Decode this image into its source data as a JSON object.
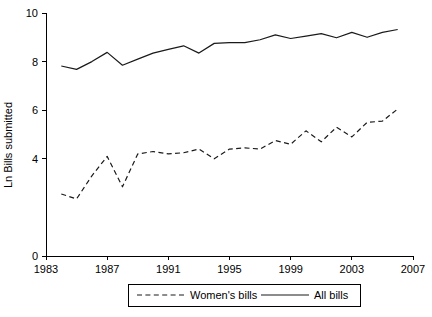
{
  "chart_data": {
    "type": "line",
    "title": "",
    "xlabel": "",
    "ylabel": "Ln Bills submitted",
    "xlim": [
      1983,
      2007
    ],
    "ylim": [
      0,
      10
    ],
    "xticks": [
      1983,
      1987,
      1991,
      1995,
      1999,
      2003,
      2007
    ],
    "xtick_labels": [
      "1983",
      "1987",
      "1991",
      "1995",
      "1999",
      "2003",
      "2007"
    ],
    "yticks": [
      0,
      4,
      6,
      8,
      10
    ],
    "ytick_labels": [
      "0",
      "4",
      "6",
      "8",
      "10"
    ],
    "grid": false,
    "legend_position": "below-center",
    "x": [
      1984,
      1985,
      1986,
      1987,
      1988,
      1989,
      1990,
      1991,
      1992,
      1993,
      1994,
      1995,
      1996,
      1997,
      1998,
      1999,
      2000,
      2001,
      2002,
      2003,
      2004,
      2005,
      2006
    ],
    "series": [
      {
        "name": "Women's bills",
        "style": "dashed",
        "color": "#1a1a1a",
        "values": [
          2.55,
          2.35,
          3.3,
          4.1,
          2.85,
          4.2,
          4.3,
          4.2,
          4.25,
          4.4,
          4.0,
          4.4,
          4.45,
          4.4,
          4.75,
          4.6,
          5.15,
          4.7,
          5.3,
          4.9,
          5.5,
          5.55,
          6.05
        ]
      },
      {
        "name": "All bills",
        "style": "solid",
        "color": "#1a1a1a",
        "values": [
          7.82,
          7.68,
          8.0,
          8.38,
          7.85,
          8.1,
          8.35,
          8.5,
          8.65,
          8.35,
          8.75,
          8.78,
          8.78,
          8.9,
          9.1,
          8.95,
          9.05,
          9.15,
          8.98,
          9.2,
          9.0,
          9.2,
          9.32
        ]
      }
    ],
    "legend": [
      {
        "label": "Women's bills",
        "style": "dashed"
      },
      {
        "label": "All bills",
        "style": "solid"
      }
    ]
  }
}
